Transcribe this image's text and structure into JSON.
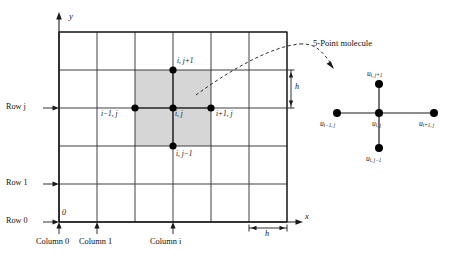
{
  "figure": {
    "type": "diagram",
    "axes": {
      "x_label": "x",
      "y_label": "y",
      "origin_label": "0"
    },
    "grid": {
      "columns": 7,
      "rows": 6,
      "spacing_label": "h",
      "spacing_label_horizontal": "h",
      "spacing_label_vertical": "h"
    },
    "row_labels": [
      {
        "text": "Row 0",
        "arrow": "→"
      },
      {
        "text": "Row 1",
        "arrow": "→"
      },
      {
        "text": "Row j",
        "arrow": "→",
        "italic_tail": "j"
      }
    ],
    "column_labels": [
      {
        "text": "Column 0"
      },
      {
        "text": "Column 1"
      },
      {
        "text": "Column i",
        "italic_tail": "i"
      }
    ],
    "grid_nodes": [
      {
        "id": "node-top",
        "label": "i, j+1"
      },
      {
        "id": "node-left",
        "label": "i−1, j"
      },
      {
        "id": "node-center",
        "label": "i, j"
      },
      {
        "id": "node-right",
        "label": "i+1, j"
      },
      {
        "id": "node-bottom",
        "label": "i, j−1"
      }
    ],
    "callout": {
      "title": "5-Point molecule",
      "connector": "dashed-curved-arrow"
    },
    "molecule_nodes": [
      {
        "id": "mol-top",
        "base": "u",
        "sub": "i, j+1"
      },
      {
        "id": "mol-left",
        "base": "u",
        "sub": "i−1, j"
      },
      {
        "id": "mol-center",
        "base": "u",
        "sub": "i, j"
      },
      {
        "id": "mol-right",
        "base": "u",
        "sub": "i+1, j"
      },
      {
        "id": "mol-bottom",
        "base": "u",
        "sub": "i, j−1"
      }
    ],
    "colors": {
      "line": "#1a1a1a",
      "grid": "#2b2b2b",
      "shaded_cell": "#d6d6d6",
      "background": "#ffffff",
      "node": "#000000"
    }
  }
}
